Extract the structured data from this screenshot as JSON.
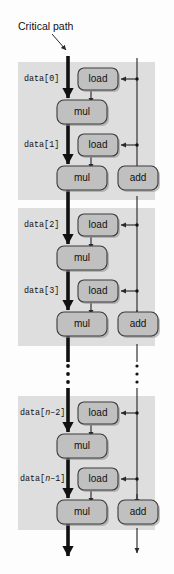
{
  "figure": {
    "title_annotation": "Critical path",
    "background_color": "#fdfdfd",
    "band_color": "#dedede",
    "node_fill": "#c0c0c0",
    "node_stroke": "#3a3a3a",
    "critical_path_color": "#111111"
  },
  "annotations": [
    {
      "id": "critical-path",
      "text": "Critical path"
    }
  ],
  "bands": [
    {
      "id": "band-0-1",
      "labels": [
        {
          "id": "data-0",
          "prefix": "data[",
          "index": "0",
          "suffix": "]",
          "italic_index": false
        },
        {
          "id": "data-1",
          "prefix": "data[",
          "index": "1",
          "suffix": "]",
          "italic_index": false
        }
      ]
    },
    {
      "id": "band-2-3",
      "labels": [
        {
          "id": "data-2",
          "prefix": "data[",
          "index": "2",
          "suffix": "]",
          "italic_index": false
        },
        {
          "id": "data-3",
          "prefix": "data[",
          "index": "3",
          "suffix": "]",
          "italic_index": false
        }
      ]
    },
    {
      "id": "band-n2-n1",
      "labels": [
        {
          "id": "data-n-2",
          "prefix": "data[",
          "index": "n",
          "suffix": "–2]",
          "italic_index": true
        },
        {
          "id": "data-n-1",
          "prefix": "data[",
          "index": "n",
          "suffix": "–1]",
          "italic_index": true
        }
      ]
    }
  ],
  "node_labels": {
    "load": "load",
    "mul": "mul",
    "add": "add"
  },
  "nodes": [
    {
      "id": "load-0",
      "type": "load",
      "label": "load"
    },
    {
      "id": "mul-0",
      "type": "mul",
      "label": "mul"
    },
    {
      "id": "load-1",
      "type": "load",
      "label": "load"
    },
    {
      "id": "mul-1",
      "type": "mul",
      "label": "mul"
    },
    {
      "id": "add-1",
      "type": "add",
      "label": "add"
    },
    {
      "id": "load-2",
      "type": "load",
      "label": "load"
    },
    {
      "id": "mul-2",
      "type": "mul",
      "label": "mul"
    },
    {
      "id": "load-3",
      "type": "load",
      "label": "load"
    },
    {
      "id": "mul-3",
      "type": "mul",
      "label": "mul"
    },
    {
      "id": "add-3",
      "type": "add",
      "label": "add"
    },
    {
      "id": "load-n-2",
      "type": "load",
      "label": "load"
    },
    {
      "id": "mul-n-2",
      "type": "mul",
      "label": "mul"
    },
    {
      "id": "load-n-1",
      "type": "load",
      "label": "load"
    },
    {
      "id": "mul-n-1",
      "type": "mul",
      "label": "mul"
    },
    {
      "id": "add-n-1",
      "type": "add",
      "label": "add"
    }
  ],
  "ellipsis": [
    {
      "id": "ellipsis-left",
      "dots": 3
    },
    {
      "id": "ellipsis-right",
      "dots": 3
    }
  ]
}
